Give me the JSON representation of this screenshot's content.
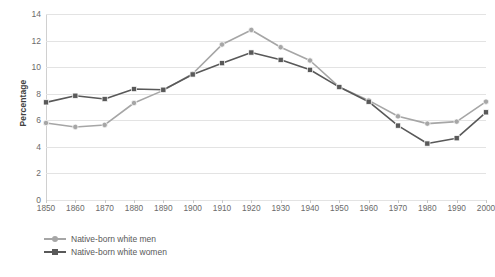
{
  "chart_data": {
    "type": "line",
    "title": "",
    "xlabel": "",
    "ylabel": "Percentage",
    "ylim": [
      0,
      14
    ],
    "ytick_step": 2,
    "yticks": [
      "0",
      "2",
      "4",
      "6",
      "8",
      "10",
      "12",
      "14"
    ],
    "grid": "horizontal",
    "legend_position": "bottom-left",
    "categories": [
      "1850",
      "1860",
      "1870",
      "1880",
      "1890",
      "1900",
      "1910",
      "1920",
      "1930",
      "1940",
      "1950",
      "1960",
      "1970",
      "1980",
      "1990",
      "2000"
    ],
    "series": [
      {
        "name": "Native-born white men",
        "color": "#a6a6a6",
        "marker": "circle",
        "values": [
          5.8,
          5.5,
          5.65,
          7.3,
          8.25,
          9.5,
          11.7,
          12.8,
          11.5,
          10.5,
          8.5,
          7.5,
          6.3,
          5.75,
          5.9,
          7.4
        ]
      },
      {
        "name": "Native-born white women",
        "color": "#595959",
        "marker": "square",
        "values": [
          7.35,
          7.85,
          7.6,
          8.35,
          8.3,
          9.45,
          10.3,
          11.1,
          10.55,
          9.8,
          8.5,
          7.4,
          5.6,
          4.25,
          4.65,
          6.6
        ]
      }
    ]
  },
  "legend": {
    "items": [
      {
        "label": "Native-born white men"
      },
      {
        "label": "Native-born white women"
      }
    ]
  },
  "colors": {
    "men": "#a6a6a6",
    "women": "#595959",
    "gridline": "#e3e3e3",
    "axis": "#b8b8b8",
    "text": "#6b6b6b",
    "background": "#ffffff"
  }
}
